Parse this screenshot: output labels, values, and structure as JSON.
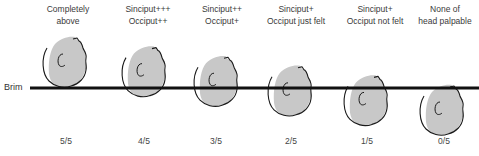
{
  "figure": {
    "brim_label": "Brim",
    "colors": {
      "head_fill": "#c8c8c8",
      "outline": "#1a1a1a",
      "brim_line": "#111111",
      "text": "#333333"
    },
    "stages": [
      {
        "caption": [
          "Completely",
          "above"
        ],
        "fraction": "5/5",
        "fifths_palpable": 5
      },
      {
        "caption": [
          "Sinciput+++",
          "Occiput++"
        ],
        "fraction": "4/5",
        "fifths_palpable": 4
      },
      {
        "caption": [
          "Sinciput++",
          "Occiput+"
        ],
        "fraction": "3/5",
        "fifths_palpable": 3
      },
      {
        "caption": [
          "Sinciput+",
          "Occiput just felt"
        ],
        "fraction": "2/5",
        "fifths_palpable": 2
      },
      {
        "caption": [
          "Sinciput+",
          "Occiput not felt"
        ],
        "fraction": "1/5",
        "fifths_palpable": 1
      },
      {
        "caption": [
          "None of",
          "head palpable"
        ],
        "fraction": "0/5",
        "fifths_palpable": 0
      }
    ]
  }
}
